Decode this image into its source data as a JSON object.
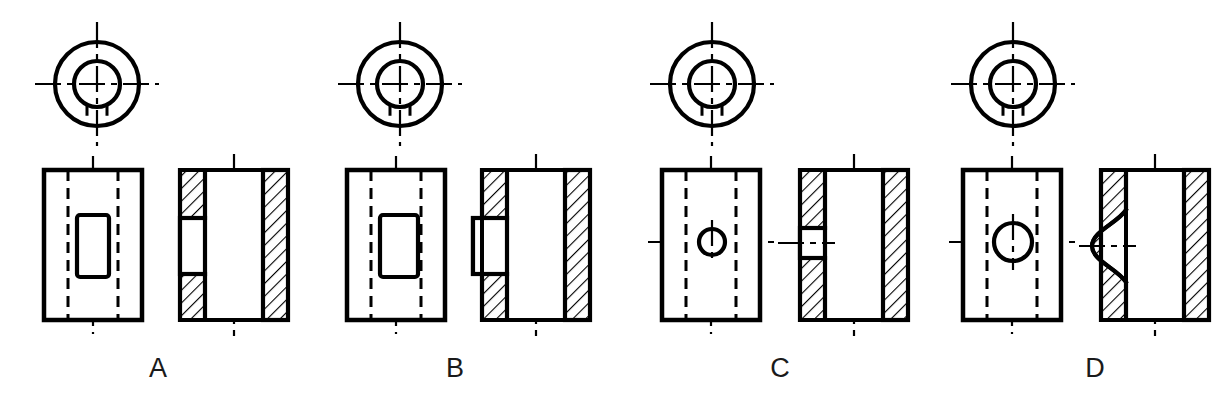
{
  "figure": {
    "background_color": "#ffffff",
    "line_color": "#000000",
    "hatch_color": "#000000",
    "label_color": "#1a1a1a",
    "option_count": 4
  },
  "options": [
    {
      "id": "A",
      "label": "A",
      "label_x": 158,
      "label_y": 377,
      "top_view": {
        "name": "circular-top-view",
        "center_x": 97,
        "center_y": 84,
        "outer_radius": 42,
        "inner_radius": 23,
        "keyway_dash_offset": 10,
        "keyway_style": "hidden-dashed",
        "centerline_h_half_length": 62,
        "centerline_v_half_length": 62
      },
      "front_view": {
        "name": "front-view",
        "x": 44,
        "y": 170,
        "width": 98,
        "height": 150,
        "hidden_line_left_offset": 24,
        "hidden_line_right_offset": 24,
        "feature": "rectangular-slot-visible",
        "slot_x_offset": 33,
        "slot_y_offset": 45,
        "slot_width": 32,
        "slot_height": 62,
        "slot_rounded": false,
        "centerline": "vertical"
      },
      "section_view": {
        "name": "section-view",
        "x": 180,
        "y": 170,
        "width": 108,
        "height": 150,
        "wall_thickness": 25,
        "notch": "blind-rectangular-pocket-in-left-wall",
        "notch_y_offset": 48,
        "notch_height": 56,
        "notch_depth": 25,
        "notch_extends_to_outer_face": true,
        "notch_inner_wall_remains": true,
        "hatch_angle_degrees": 45,
        "centerline": "vertical"
      }
    },
    {
      "id": "B",
      "label": "B",
      "label_x": 455,
      "label_y": 377,
      "top_view": {
        "name": "circular-top-view",
        "center_x": 400,
        "center_y": 84,
        "outer_radius": 42,
        "inner_radius": 23,
        "keyway_dash_offset": 10,
        "keyway_style": "hidden-dashed",
        "centerline_h_half_length": 62,
        "centerline_v_half_length": 62
      },
      "front_view": {
        "name": "front-view",
        "x": 347,
        "y": 170,
        "width": 98,
        "height": 150,
        "hidden_line_left_offset": 24,
        "hidden_line_right_offset": 24,
        "feature": "rectangular-slot-visible",
        "slot_x_offset": 33,
        "slot_y_offset": 45,
        "slot_width": 38,
        "slot_height": 62,
        "slot_rounded": false,
        "centerline": "vertical"
      },
      "section_view": {
        "name": "section-view",
        "x": 482,
        "y": 170,
        "width": 108,
        "height": 150,
        "wall_thickness": 25,
        "notch": "through-rectangular-slot-open-to-left-face",
        "notch_y_offset": 48,
        "notch_height": 56,
        "notch_depth": 34,
        "notch_extends_to_outer_face": true,
        "notch_protrudes_outside": true,
        "hatch_angle_degrees": 45,
        "centerline": "vertical"
      }
    },
    {
      "id": "C",
      "label": "C",
      "label_x": 780,
      "label_y": 377,
      "top_view": {
        "name": "circular-top-view",
        "center_x": 712,
        "center_y": 84,
        "outer_radius": 42,
        "inner_radius": 23,
        "keyway_dash_offset": 10,
        "keyway_style": "hidden-dashed",
        "centerline_h_half_length": 62,
        "centerline_v_half_length": 62
      },
      "front_view": {
        "name": "front-view",
        "x": 662,
        "y": 170,
        "width": 98,
        "height": 150,
        "hidden_line_left_offset": 24,
        "hidden_line_right_offset": 24,
        "feature": "small-circular-hole-visible",
        "hole_center_x": 712,
        "hole_center_y": 242,
        "hole_radius": 13,
        "centerline": "vertical-and-horizontal"
      },
      "section_view": {
        "name": "section-view",
        "x": 800,
        "y": 170,
        "width": 108,
        "height": 150,
        "wall_thickness": 25,
        "notch": "small-rectangular-pocket-in-left-wall",
        "notch_y_offset": 58,
        "notch_height": 30,
        "notch_depth": 25,
        "notch_extends_to_outer_face": true,
        "hatch_angle_degrees": 45,
        "centerline": "vertical-and-horizontal"
      }
    },
    {
      "id": "D",
      "label": "D",
      "label_x": 1095,
      "label_y": 377,
      "top_view": {
        "name": "circular-top-view",
        "center_x": 1013,
        "center_y": 84,
        "outer_radius": 42,
        "inner_radius": 23,
        "keyway_dash_offset": 10,
        "keyway_style": "hidden-dashed",
        "centerline_h_half_length": 62,
        "centerline_v_half_length": 62
      },
      "front_view": {
        "name": "front-view",
        "x": 963,
        "y": 170,
        "width": 98,
        "height": 150,
        "hidden_line_left_offset": 24,
        "hidden_line_right_offset": 24,
        "feature": "circular-hole-visible",
        "hole_center_x": 1013,
        "hole_center_y": 242,
        "hole_radius": 19,
        "centerline": "vertical-and-horizontal"
      },
      "section_view": {
        "name": "section-view",
        "x": 1101,
        "y": 170,
        "width": 108,
        "height": 150,
        "wall_thickness": 25,
        "notch": "curved-spherical-scallop-in-left-wall",
        "notch_y_offset": 40,
        "notch_height": 72,
        "notch_depth": 34,
        "notch_curved": true,
        "hatch_angle_degrees": 45,
        "centerline": "vertical-and-horizontal"
      }
    }
  ]
}
